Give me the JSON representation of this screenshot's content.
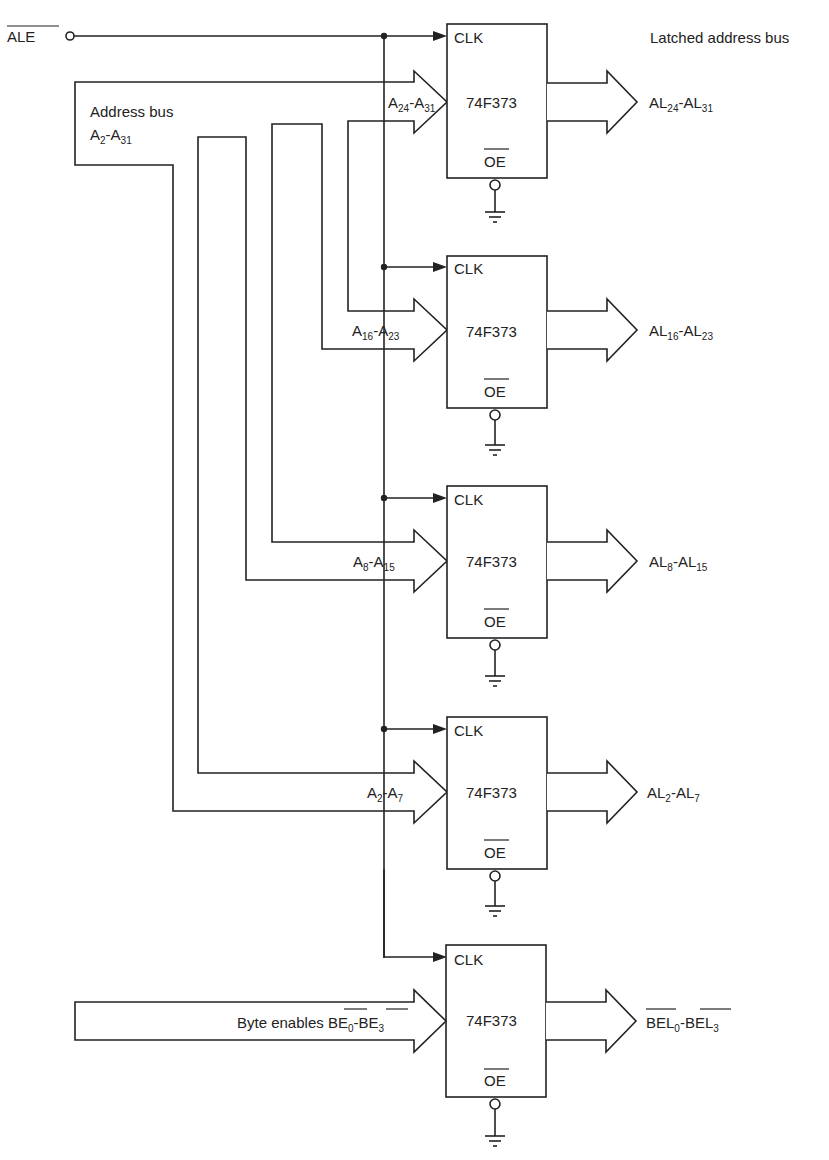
{
  "diagram": {
    "title_label": "Latched address bus",
    "ale": {
      "text": "ALE",
      "active_low": true
    },
    "address_bus": {
      "line1": "Address bus",
      "line2_main": "A",
      "line2_sub1": "2",
      "line2_dash": "-",
      "line2_main2": "A",
      "line2_sub2": "31"
    },
    "latch_part": "74F373",
    "clk_label": "CLK",
    "oe_label": "OE",
    "latches": [
      {
        "in_main": "A",
        "in_sub1": "24",
        "in_main2": "A",
        "in_sub2": "31",
        "out_main": "AL",
        "out_sub1": "24",
        "out_main2": "AL",
        "out_sub2": "31"
      },
      {
        "in_main": "A",
        "in_sub1": "16",
        "in_main2": "A",
        "in_sub2": "23",
        "out_main": "AL",
        "out_sub1": "16",
        "out_main2": "AL",
        "out_sub2": "23"
      },
      {
        "in_main": "A",
        "in_sub1": "8",
        "in_main2": "A",
        "in_sub2": "15",
        "out_main": "AL",
        "out_sub1": "8",
        "out_main2": "AL",
        "out_sub2": "15"
      },
      {
        "in_main": "A",
        "in_sub1": "2",
        "in_main2": "A",
        "in_sub2": "7",
        "out_main": "AL",
        "out_sub1": "2",
        "out_main2": "AL",
        "out_sub2": "7"
      },
      {
        "in_prefix": "Byte enables ",
        "in_main": "BE",
        "in_sub1": "0",
        "in_main2": "BE",
        "in_sub2": "3",
        "out_main": "BEL",
        "out_sub1": "0",
        "out_main2": "BEL",
        "out_sub2": "3",
        "active_low": true
      }
    ],
    "dash": "-",
    "colors": {
      "line": "#222222",
      "background": "#ffffff"
    }
  }
}
